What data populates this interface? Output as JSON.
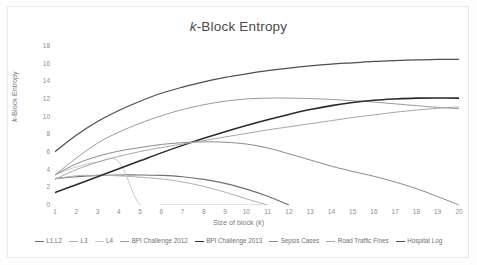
{
  "chart_data": {
    "type": "line",
    "title": "k-Block Entropy",
    "title_plain": "k-Block Entropy",
    "xlabel": "Size of block (k)",
    "ylabel": "k-Block Entropy",
    "xlim": [
      1,
      20
    ],
    "ylim": [
      0,
      18
    ],
    "x_ticks": [
      1,
      2,
      3,
      4,
      5,
      6,
      7,
      8,
      9,
      10,
      11,
      12,
      13,
      14,
      15,
      16,
      17,
      18,
      19,
      20
    ],
    "y_ticks": [
      0,
      2,
      4,
      6,
      8,
      10,
      12,
      14,
      16,
      18
    ],
    "grid": false,
    "legend_position": "bottom",
    "x": [
      1,
      2,
      3,
      4,
      5,
      6,
      7,
      8,
      9,
      10,
      11,
      12,
      13,
      14,
      15,
      16,
      17,
      18,
      19,
      20
    ],
    "series": [
      {
        "name": "L1,L2",
        "color": "#6f6f6f",
        "width": 1.1,
        "values": [
          3.0,
          3.2,
          3.35,
          3.4,
          3.4,
          3.35,
          3.2,
          2.9,
          2.45,
          1.8,
          1.0,
          0,
          null,
          null,
          null,
          null,
          null,
          null,
          null,
          null
        ]
      },
      {
        "name": "L3",
        "color": "#b0b0b0",
        "width": 1.0,
        "values": [
          2.95,
          3.3,
          3.35,
          3.3,
          3.15,
          2.95,
          2.6,
          2.1,
          1.45,
          0.7,
          0,
          null,
          null,
          null,
          null,
          null,
          null,
          null,
          null,
          null
        ]
      },
      {
        "name": "L4",
        "color": "#c9c9c9",
        "width": 1.0,
        "values": [
          3.45,
          4.3,
          4.85,
          4.9,
          0,
          0,
          0,
          0,
          0,
          0,
          0,
          null,
          null,
          null,
          null,
          null,
          null,
          null,
          null,
          null
        ]
      },
      {
        "name": "BPI Challenge 2012",
        "color": "#9a9a9a",
        "width": 1.0,
        "values": [
          3.4,
          5.3,
          7.0,
          8.25,
          9.25,
          10.1,
          10.8,
          11.35,
          11.75,
          12.0,
          12.1,
          12.1,
          12.05,
          11.95,
          11.8,
          11.65,
          11.45,
          11.25,
          11.05,
          10.9
        ]
      },
      {
        "name": "BPI Challenge 2013",
        "color": "#2b2b2b",
        "width": 1.55,
        "values": [
          1.4,
          2.3,
          3.2,
          4.1,
          5.0,
          5.9,
          6.75,
          7.55,
          8.3,
          9.0,
          9.65,
          10.25,
          10.8,
          11.25,
          11.6,
          11.85,
          12.0,
          12.1,
          12.12,
          12.1
        ]
      },
      {
        "name": "Sepsis Cases",
        "color": "#8a8a8a",
        "width": 1.0,
        "values": [
          3.4,
          4.65,
          5.5,
          6.1,
          6.5,
          6.85,
          7.05,
          7.15,
          7.1,
          6.9,
          6.45,
          5.8,
          5.1,
          4.4,
          3.8,
          3.25,
          2.6,
          1.85,
          0.95,
          0.0
        ]
      },
      {
        "name": "Road Traffic Fines",
        "color": "#a6a6a6",
        "width": 1.0,
        "values": [
          2.9,
          4.0,
          4.85,
          5.5,
          6.05,
          6.5,
          6.9,
          7.3,
          7.7,
          8.1,
          8.5,
          8.85,
          9.2,
          9.55,
          9.9,
          10.2,
          10.5,
          10.75,
          10.95,
          11.1
        ]
      },
      {
        "name": "Hospital  Log",
        "color": "#4f4f4f",
        "width": 1.25,
        "values": [
          6.05,
          7.9,
          9.45,
          10.7,
          11.75,
          12.65,
          13.35,
          13.95,
          14.45,
          14.85,
          15.2,
          15.5,
          15.75,
          15.95,
          16.1,
          16.25,
          16.35,
          16.42,
          16.48,
          16.5
        ]
      }
    ]
  },
  "axes": {
    "y_tick_labels": [
      "18",
      "16",
      "14",
      "12",
      "10",
      "8",
      "6",
      "4",
      "2",
      "0"
    ],
    "x_tick_labels": [
      "1",
      "2",
      "3",
      "4",
      "5",
      "6",
      "7",
      "8",
      "9",
      "10",
      "11",
      "12",
      "13",
      "14",
      "15",
      "16",
      "17",
      "18",
      "19",
      "20"
    ]
  },
  "legend": {
    "items": [
      {
        "label": "L1,L2",
        "color": "#6f6f6f",
        "width": 1.1
      },
      {
        "label": "L3",
        "color": "#b0b0b0",
        "width": 1.0
      },
      {
        "label": "L4",
        "color": "#c9c9c9",
        "width": 1.0
      },
      {
        "label": "BPI Challenge 2012",
        "color": "#9a9a9a",
        "width": 1.0
      },
      {
        "label": "BPI Challenge 2013",
        "color": "#2b2b2b",
        "width": 1.55
      },
      {
        "label": "Sepsis Cases",
        "color": "#8a8a8a",
        "width": 1.0
      },
      {
        "label": "Road Traffic Fines",
        "color": "#a6a6a6",
        "width": 1.0
      },
      {
        "label": "Hospital  Log",
        "color": "#4f4f4f",
        "width": 1.25
      }
    ]
  }
}
